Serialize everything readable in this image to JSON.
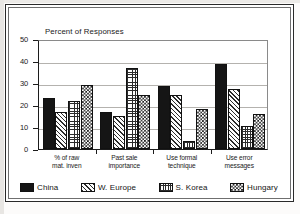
{
  "chart_data": {
    "type": "bar",
    "title": "Percent of Responses",
    "xlabel": "",
    "ylabel": "",
    "ylim": [
      0,
      50
    ],
    "yticks": [
      "0",
      "10",
      "20",
      "30",
      "40",
      "50"
    ],
    "grid": true,
    "legend_position": "bottom",
    "categories": [
      "% of raw\nmat. inven",
      "Past sale\nimportance",
      "Use formal\ntechnique",
      "Use error\nmessages"
    ],
    "categories_lines": [
      [
        "% of raw",
        "mat. inven"
      ],
      [
        "Past sale",
        "importance"
      ],
      [
        "Use formal",
        "technique"
      ],
      [
        "Use error",
        "messages"
      ]
    ],
    "series": [
      {
        "name": "China",
        "pattern": "solid-black",
        "values": [
          23,
          17,
          28.5,
          38.5
        ]
      },
      {
        "name": "W. Europe",
        "pattern": "diagonal-hatch",
        "values": [
          17,
          15,
          24.5,
          27.5
        ]
      },
      {
        "name": "S. Korea",
        "pattern": "fine-grid",
        "values": [
          22,
          37,
          3.5,
          10.5
        ]
      },
      {
        "name": "Hungary",
        "pattern": "checkerboard",
        "values": [
          29,
          24.5,
          18,
          16
        ]
      }
    ]
  },
  "colors": {
    "axis": "#1c1c1c",
    "gridline": "#b4b2ae",
    "frame": "#2a2a2a",
    "plot_background": "#ffffff",
    "series_china": "#151515",
    "series_pattern": "#2b2b2b"
  }
}
